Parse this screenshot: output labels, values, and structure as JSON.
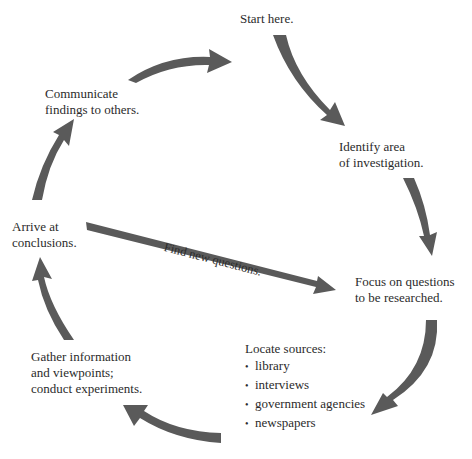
{
  "diagram": {
    "type": "cycle",
    "arrow_color": "#5a5a5a",
    "nodes": [
      {
        "id": "start",
        "lines": [
          "Start here."
        ]
      },
      {
        "id": "identify",
        "lines": [
          "Identify area",
          "of investigation."
        ]
      },
      {
        "id": "focus",
        "lines": [
          "Focus on questions",
          "to be researched."
        ]
      },
      {
        "id": "locate",
        "heading": "Locate sources:",
        "bullets": [
          "library",
          "interviews",
          "government agencies",
          "newspapers"
        ]
      },
      {
        "id": "gather",
        "lines": [
          "Gather information",
          "and viewpoints;",
          "conduct experiments."
        ]
      },
      {
        "id": "arrive",
        "lines": [
          "Arrive at",
          "conclusions."
        ]
      },
      {
        "id": "communicate",
        "lines": [
          "Communicate",
          "findings to others."
        ]
      }
    ],
    "edges": [
      {
        "from": "start",
        "to": "identify"
      },
      {
        "from": "identify",
        "to": "focus"
      },
      {
        "from": "focus",
        "to": "locate"
      },
      {
        "from": "locate",
        "to": "gather"
      },
      {
        "from": "gather",
        "to": "arrive"
      },
      {
        "from": "arrive",
        "to": "communicate"
      },
      {
        "from": "communicate",
        "to": "start"
      },
      {
        "from": "arrive",
        "to": "focus",
        "label": "Find new questions."
      }
    ],
    "bullet_glyph": "•"
  }
}
